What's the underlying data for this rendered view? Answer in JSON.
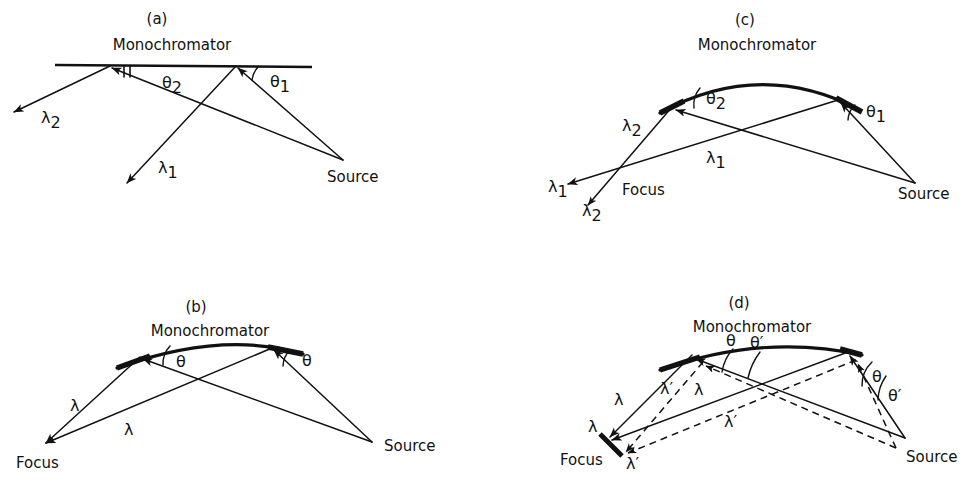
{
  "figure": {
    "background_color": "#ffffff",
    "ink_color": "#111111",
    "width": 980,
    "height": 489,
    "type": "optical-ray-diagram"
  },
  "panels": [
    {
      "id": "a",
      "caption": "(a)",
      "caption_pos": {
        "x": 157,
        "y": 19
      },
      "title": "Monochromator",
      "title_pos": {
        "x": 172,
        "y": 44
      },
      "mirror_type": "flat",
      "mirror": {
        "x1": 55,
        "y1": 65,
        "x2": 312,
        "y2": 67
      },
      "points": {
        "left_reflection": {
          "x": 110,
          "y": 66
        },
        "right_reflection": {
          "x": 236,
          "y": 66
        },
        "source": {
          "x": 343,
          "y": 160
        },
        "lambda2_end": {
          "x": 14,
          "y": 112
        },
        "lambda1_end": {
          "x": 127,
          "y": 183
        }
      },
      "labels": [
        {
          "text": "θ",
          "sub": "2",
          "x": 162,
          "y": 83,
          "name": "theta2-label"
        },
        {
          "text": "θ",
          "sub": "1",
          "x": 270,
          "y": 82,
          "name": "theta1-label"
        },
        {
          "text": "λ",
          "sub": "2",
          "x": 41,
          "y": 118,
          "name": "lambda2-label"
        },
        {
          "text": "λ",
          "sub": "1",
          "x": 158,
          "y": 168,
          "name": "lambda1-label"
        },
        {
          "text": "Source",
          "sub": "",
          "x": 327,
          "y": 175,
          "name": "source-label"
        }
      ]
    },
    {
      "id": "b",
      "caption": "(b)",
      "caption_pos": {
        "x": 196,
        "y": 307
      },
      "title": "Monochromator",
      "title_pos": {
        "x": 148,
        "y": 330
      },
      "mirror_type": "curved",
      "mirror": {
        "x1": 117,
        "y1": 368,
        "cx": 222,
        "cy": 330,
        "x2": 303,
        "y2": 354
      },
      "points": {
        "left_reflection": {
          "x": 140,
          "y": 357
        },
        "right_reflection": {
          "x": 272,
          "y": 348
        },
        "focus": {
          "x": 46,
          "y": 443
        },
        "source": {
          "x": 372,
          "y": 442
        }
      },
      "labels": [
        {
          "text": "θ",
          "sub": "",
          "x": 170,
          "y": 361,
          "name": "theta-left-label"
        },
        {
          "text": "θ",
          "sub": "",
          "x": 300,
          "y": 360,
          "name": "theta-right-label"
        },
        {
          "text": "λ",
          "sub": "",
          "x": 70,
          "y": 404,
          "name": "lambda-upper-label"
        },
        {
          "text": "λ",
          "sub": "",
          "x": 124,
          "y": 428,
          "name": "lambda-lower-label"
        },
        {
          "text": "Focus",
          "sub": "",
          "x": 16,
          "y": 461,
          "name": "focus-label"
        },
        {
          "text": "Source",
          "sub": "",
          "x": 384,
          "y": 444,
          "name": "source-label"
        }
      ]
    },
    {
      "id": "c",
      "caption": "(c)",
      "caption_pos": {
        "x": 745,
        "y": 20
      },
      "title": "Monochromator",
      "title_pos": {
        "x": 694,
        "y": 44
      },
      "mirror_type": "curved",
      "mirror": {
        "x1": 660,
        "y1": 113,
        "cx": 760,
        "cy": 62,
        "x2": 860,
        "y2": 110
      },
      "points": {
        "left_reflection": {
          "x": 672,
          "y": 107
        },
        "right_reflection": {
          "x": 838,
          "y": 100
        },
        "focus": {
          "x": 617,
          "y": 175
        },
        "source": {
          "x": 915,
          "y": 183
        },
        "lambda1_end": {
          "x": 568,
          "y": 184
        },
        "lambda2_end": {
          "x": 588,
          "y": 205
        }
      },
      "labels": [
        {
          "text": "θ",
          "sub": "2",
          "x": 702,
          "y": 99,
          "name": "theta2-label"
        },
        {
          "text": "θ",
          "sub": "1",
          "x": 862,
          "y": 110,
          "name": "theta1-label"
        },
        {
          "text": "λ",
          "sub": "2",
          "x": 625,
          "y": 126,
          "name": "lambda2-upper-label"
        },
        {
          "text": "λ",
          "sub": "1",
          "x": 708,
          "y": 157,
          "name": "lambda1-upper-label"
        },
        {
          "text": "λ",
          "sub": "1",
          "x": 550,
          "y": 186,
          "name": "lambda1-end-label"
        },
        {
          "text": "λ",
          "sub": "2",
          "x": 584,
          "y": 210,
          "name": "lambda2-end-label"
        },
        {
          "text": "Focus",
          "sub": "",
          "x": 622,
          "y": 188,
          "name": "focus-label"
        },
        {
          "text": "Source",
          "sub": "",
          "x": 900,
          "y": 192,
          "name": "source-label"
        }
      ]
    },
    {
      "id": "d",
      "caption": "(d)",
      "caption_pos": {
        "x": 739,
        "y": 303
      },
      "title": "Monochromator",
      "title_pos": {
        "x": 690,
        "y": 326
      },
      "mirror_type": "curved",
      "mirror": {
        "x1": 660,
        "y1": 370,
        "cx": 763,
        "cy": 337,
        "x2": 862,
        "y2": 355
      },
      "points": {
        "left_reflection": {
          "x": 692,
          "y": 355
        },
        "right_reflection": {
          "x": 848,
          "y": 352
        },
        "focus": {
          "x": 614,
          "y": 437
        },
        "focus_prime": {
          "x": 628,
          "y": 452
        },
        "source": {
          "x": 905,
          "y": 438
        },
        "slit": {
          "x1": 600,
          "y1": 434,
          "x2": 622,
          "y2": 456
        }
      },
      "labels": [
        {
          "text": "θ",
          "sub": "",
          "x": 728,
          "y": 340,
          "name": "theta-left-label"
        },
        {
          "text": "θ′",
          "sub": "",
          "x": 754,
          "y": 342,
          "name": "theta-prime-left-label"
        },
        {
          "text": "θ",
          "sub": "",
          "x": 872,
          "y": 375,
          "name": "theta-right-label"
        },
        {
          "text": "θ′",
          "sub": "",
          "x": 888,
          "y": 394,
          "name": "theta-prime-right-label"
        },
        {
          "text": "λ",
          "sub": "",
          "x": 618,
          "y": 398,
          "name": "lambda-upper-left-label"
        },
        {
          "text": "λ′",
          "sub": "",
          "x": 663,
          "y": 388,
          "name": "lambda-prime-upper-label"
        },
        {
          "text": "λ",
          "sub": "",
          "x": 695,
          "y": 389,
          "name": "lambda-mid-label"
        },
        {
          "text": "λ′",
          "sub": "",
          "x": 727,
          "y": 420,
          "name": "lambda-prime-mid-label"
        },
        {
          "text": "λ",
          "sub": "",
          "x": 592,
          "y": 425,
          "name": "lambda-focus-label"
        },
        {
          "text": "λ′",
          "sub": "",
          "x": 629,
          "y": 462,
          "name": "lambda-prime-focus-label"
        },
        {
          "text": "Focus",
          "sub": "",
          "x": 564,
          "y": 458,
          "name": "focus-label"
        },
        {
          "text": "Source",
          "sub": "",
          "x": 909,
          "y": 455,
          "name": "source-label"
        }
      ]
    }
  ],
  "legend_note": {
    "solid_means": "λ rays",
    "dashed_means": "λ′ rays"
  }
}
